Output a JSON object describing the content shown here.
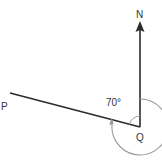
{
  "diagram": {
    "labels": {
      "north": "N",
      "point_p": "P",
      "point_q": "Q",
      "angle": "70°"
    },
    "colors": {
      "line": "#2b2b2b",
      "arc": "#9a9a9a",
      "text": "#333333"
    }
  }
}
